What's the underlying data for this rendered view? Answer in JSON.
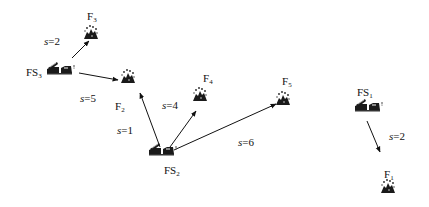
{
  "diagram": {
    "type": "fire-station-to-fire assignment",
    "stations": [
      {
        "id": "FS1",
        "base": "FS",
        "sub": "1"
      },
      {
        "id": "FS2",
        "base": "FS",
        "sub": "2"
      },
      {
        "id": "FS3",
        "base": "FS",
        "sub": "3"
      }
    ],
    "fires": [
      {
        "id": "F1",
        "base": "F",
        "sub": "1"
      },
      {
        "id": "F2",
        "base": "F",
        "sub": "2"
      },
      {
        "id": "F3",
        "base": "F",
        "sub": "3"
      },
      {
        "id": "F4",
        "base": "F",
        "sub": "4"
      },
      {
        "id": "F5",
        "base": "F",
        "sub": "5"
      }
    ],
    "edges": [
      {
        "from": "FS3",
        "to": "F3",
        "var": "s",
        "value": "=2"
      },
      {
        "from": "FS3",
        "to": "F2",
        "var": "s",
        "value": "=5"
      },
      {
        "from": "FS2",
        "to": "F2",
        "var": "s",
        "value": "=1"
      },
      {
        "from": "FS2",
        "to": "F4",
        "var": "s",
        "value": "=4"
      },
      {
        "from": "FS2",
        "to": "F5",
        "var": "s",
        "value": "=6"
      },
      {
        "from": "FS1",
        "to": "F1",
        "var": "s",
        "value": "=2"
      }
    ],
    "colors": {
      "ink": "#111111",
      "background": "#ffffff"
    }
  }
}
